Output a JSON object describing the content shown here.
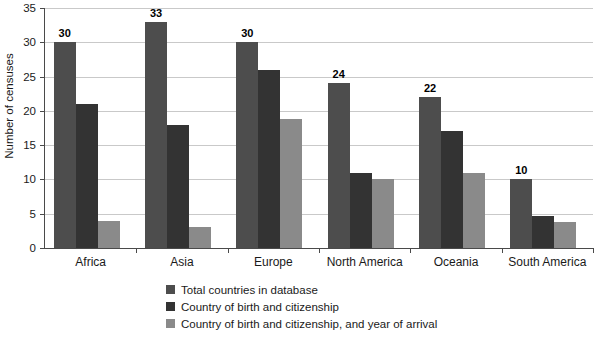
{
  "chart_data": {
    "type": "bar",
    "title": "",
    "xlabel": "",
    "ylabel": "Number of censuses",
    "ylim": [
      0,
      35
    ],
    "yticks": [
      "0",
      "5",
      "10",
      "15",
      "20",
      "25",
      "30",
      "35"
    ],
    "grid": true,
    "legend_position": "bottom",
    "categories": [
      "Africa",
      "Asia",
      "Europe",
      "North America",
      "Oceania",
      "South America"
    ],
    "series": [
      {
        "name": "Total countries in database",
        "color": "#4d4d4d",
        "values": [
          30,
          33,
          30,
          24,
          22,
          10
        ],
        "labels": [
          "30",
          "33",
          "30",
          "24",
          "22",
          "10"
        ]
      },
      {
        "name": "Country of birth and citizenship",
        "color": "#333333",
        "values": [
          21,
          18,
          26,
          11,
          17,
          4.7
        ],
        "labels": [
          "",
          "",
          "",
          "",
          "",
          ""
        ]
      },
      {
        "name": "Country of birth and citizenship, and year of arrival",
        "color": "#8a8a8a",
        "values": [
          4,
          3,
          18.8,
          10,
          10.9,
          3.8
        ],
        "labels": [
          "",
          "",
          "",
          "",
          "",
          ""
        ]
      }
    ]
  }
}
